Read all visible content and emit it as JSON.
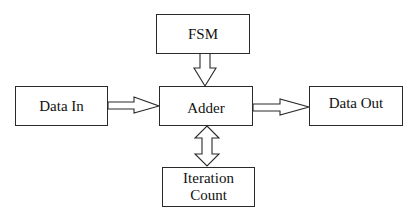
{
  "diagram": {
    "type": "block-diagram",
    "nodes": [
      {
        "id": "fsm",
        "label": "FSM"
      },
      {
        "id": "data_in",
        "label": "Data In"
      },
      {
        "id": "adder",
        "label": "Adder"
      },
      {
        "id": "data_out",
        "label": "Data Out"
      },
      {
        "id": "iteration_count",
        "label": "Iteration\nCount"
      }
    ],
    "edges": [
      {
        "from": "fsm",
        "to": "adder",
        "style": "hollow-block-arrow",
        "direction": "down"
      },
      {
        "from": "data_in",
        "to": "adder",
        "style": "hollow-block-arrow",
        "direction": "right"
      },
      {
        "from": "adder",
        "to": "data_out",
        "style": "hollow-block-arrow",
        "direction": "right"
      },
      {
        "from": "adder",
        "to": "iteration_count",
        "style": "hollow-block-arrow",
        "direction": "bidirectional"
      }
    ],
    "colors": {
      "stroke": "#2a2a2a",
      "fill": "#ffffff",
      "text": "#111111"
    }
  }
}
